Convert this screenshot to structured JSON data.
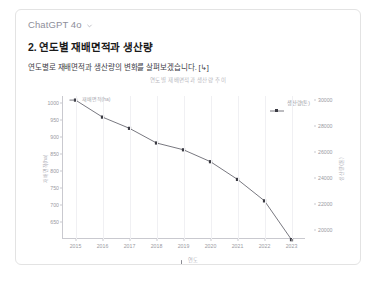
{
  "card": {
    "model_name": "ChatGPT 4o",
    "model_dropdown_icon": "chevron-down-icon",
    "title": "2. 연도별 재배면적과 생산량",
    "subtitle": "연도별로 재배면적과 생산량의 변화를 살펴보겠습니다. [↳]"
  },
  "chart_data": {
    "type": "line",
    "title": "연도별 재배면적과 생산량 추이",
    "xlabel": "연도",
    "ylabel": "재배면적(ha)",
    "y2label": "생산량(톤)",
    "categories": [
      "2015",
      "2016",
      "2017",
      "2018",
      "2019",
      "2020",
      "2021",
      "2022",
      "2023"
    ],
    "series": [
      {
        "name": "재배면적(ha)",
        "axis": "left",
        "color": "#55555f",
        "values": [
          1008,
          958,
          925,
          882,
          862,
          827,
          775,
          712,
          598
        ]
      }
    ],
    "ylim": [
      600,
      1020
    ],
    "yticks": [
      1000,
      950,
      900,
      850,
      800,
      750,
      700,
      650
    ],
    "y2lim": [
      19300,
      30300
    ],
    "y2ticks": [
      30000,
      28000,
      26000,
      24000,
      22000,
      20000
    ],
    "legend": [
      "생산량(톤)"
    ],
    "legend_position": "top-right",
    "grid": true,
    "inline_annotation": "재배면적(ha)",
    "xlabel_icon": "down-arrow-icon"
  }
}
